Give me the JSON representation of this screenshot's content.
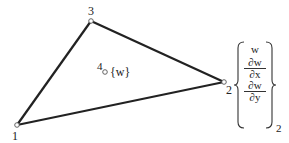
{
  "diagram": {
    "type": "triangular-element",
    "nodes": [
      {
        "id": "1",
        "label": "1",
        "x": 17,
        "y": 125
      },
      {
        "id": "2",
        "label": "2",
        "x": 224,
        "y": 82
      },
      {
        "id": "3",
        "label": "3",
        "x": 91,
        "y": 21
      },
      {
        "id": "4",
        "label": "4",
        "x": 105,
        "y": 71
      }
    ],
    "edges": [
      [
        "1",
        "3"
      ],
      [
        "3",
        "2"
      ],
      [
        "2",
        "1"
      ]
    ],
    "node4_dof": "{w}",
    "node2_dof": {
      "entries": [
        "w",
        "∂w/∂x",
        "∂w/∂y"
      ],
      "w": "w",
      "dx_num": "∂w",
      "dx_den": "∂x",
      "dy_num": "∂w",
      "dy_den": "∂y",
      "subscript": "2"
    },
    "colors": {
      "line": "#222222",
      "node_fill": "#ffffff"
    }
  }
}
